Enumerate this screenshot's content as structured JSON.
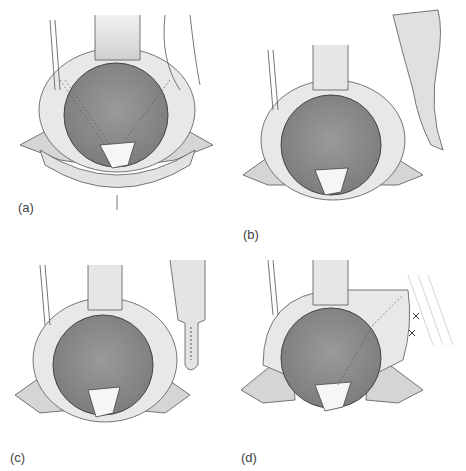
{
  "figure": {
    "panels": [
      {
        "id": "a",
        "label": "(a)",
        "description": "pelvic view with ureters crossing, bowel loop on right"
      },
      {
        "id": "b",
        "label": "(b)",
        "description": "ureter transected, bowel segment mobilized to the right"
      },
      {
        "id": "c",
        "label": "(c)",
        "description": "bowel segment tubularized with sutures"
      },
      {
        "id": "d",
        "label": "(d)",
        "description": "bowel conduit anastomosed and sutured to abdominal wall"
      }
    ],
    "colors": {
      "bladder_fill": "#8a8a8a",
      "tissue_fill": "#dcdcdc",
      "ring_fill": "#e6e6e6",
      "outline": "#555555",
      "background": "#ffffff"
    }
  }
}
